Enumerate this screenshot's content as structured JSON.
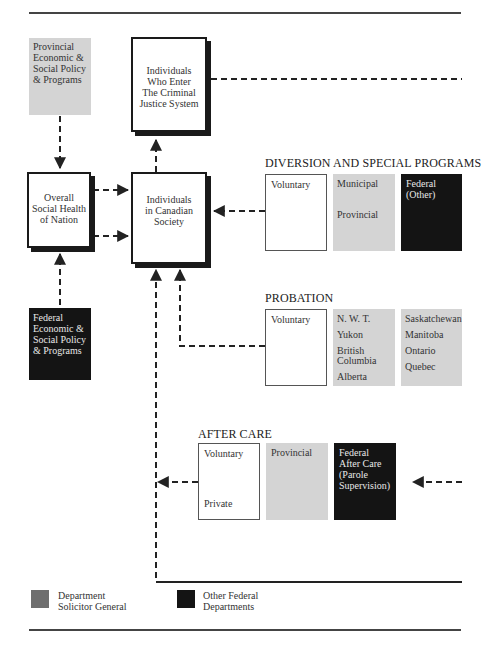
{
  "boxes": {
    "provincial_policy": {
      "lines": [
        "Provincial",
        "Economic &",
        "Social Policy",
        "& Programs"
      ]
    },
    "criminal_justice": {
      "lines": [
        "Individuals",
        "Who Enter",
        "The Criminal",
        "Justice System"
      ]
    },
    "social_health": {
      "lines": [
        "Overall",
        "Social Health",
        "of Nation"
      ]
    },
    "canadian_society": {
      "lines": [
        "Individuals",
        "in Canadian",
        "Society"
      ]
    },
    "federal_policy": {
      "lines": [
        "Federal",
        "Economic &",
        "Social Policy",
        "& Programs"
      ]
    }
  },
  "sections": {
    "diversion": {
      "title": "DIVERSION AND SPECIAL PROGRAMS",
      "voluntary": [
        "Voluntary"
      ],
      "provincial": [
        "Municipal",
        "Provincial"
      ],
      "federal": [
        "Federal",
        "(Other)"
      ]
    },
    "probation": {
      "title": "PROBATION",
      "voluntary": [
        "Voluntary"
      ],
      "col1": [
        "N. W. T.",
        "Yukon",
        "British",
        "Columbia",
        "Alberta"
      ],
      "col2": [
        "Saskatchewan",
        "Manitoba",
        "Ontario",
        "Quebec"
      ]
    },
    "after_care": {
      "title": "AFTER CARE",
      "voluntary": [
        "Voluntary",
        "Private"
      ],
      "provincial": [
        "Provincial"
      ],
      "federal": [
        "Federal",
        "After Care",
        "(Parole",
        "Supervision)"
      ]
    }
  },
  "legend": [
    {
      "label_lines": [
        "Department",
        "Solicitor General"
      ],
      "color": "#6e6e6e"
    },
    {
      "label_lines": [
        "Other Federal",
        "Departments"
      ],
      "color": "#141414"
    }
  ],
  "colors": {
    "provincial_grey": "#d4d4d4",
    "federal_black": "#141414",
    "solicitor_general_grey": "#6e6e6e"
  }
}
